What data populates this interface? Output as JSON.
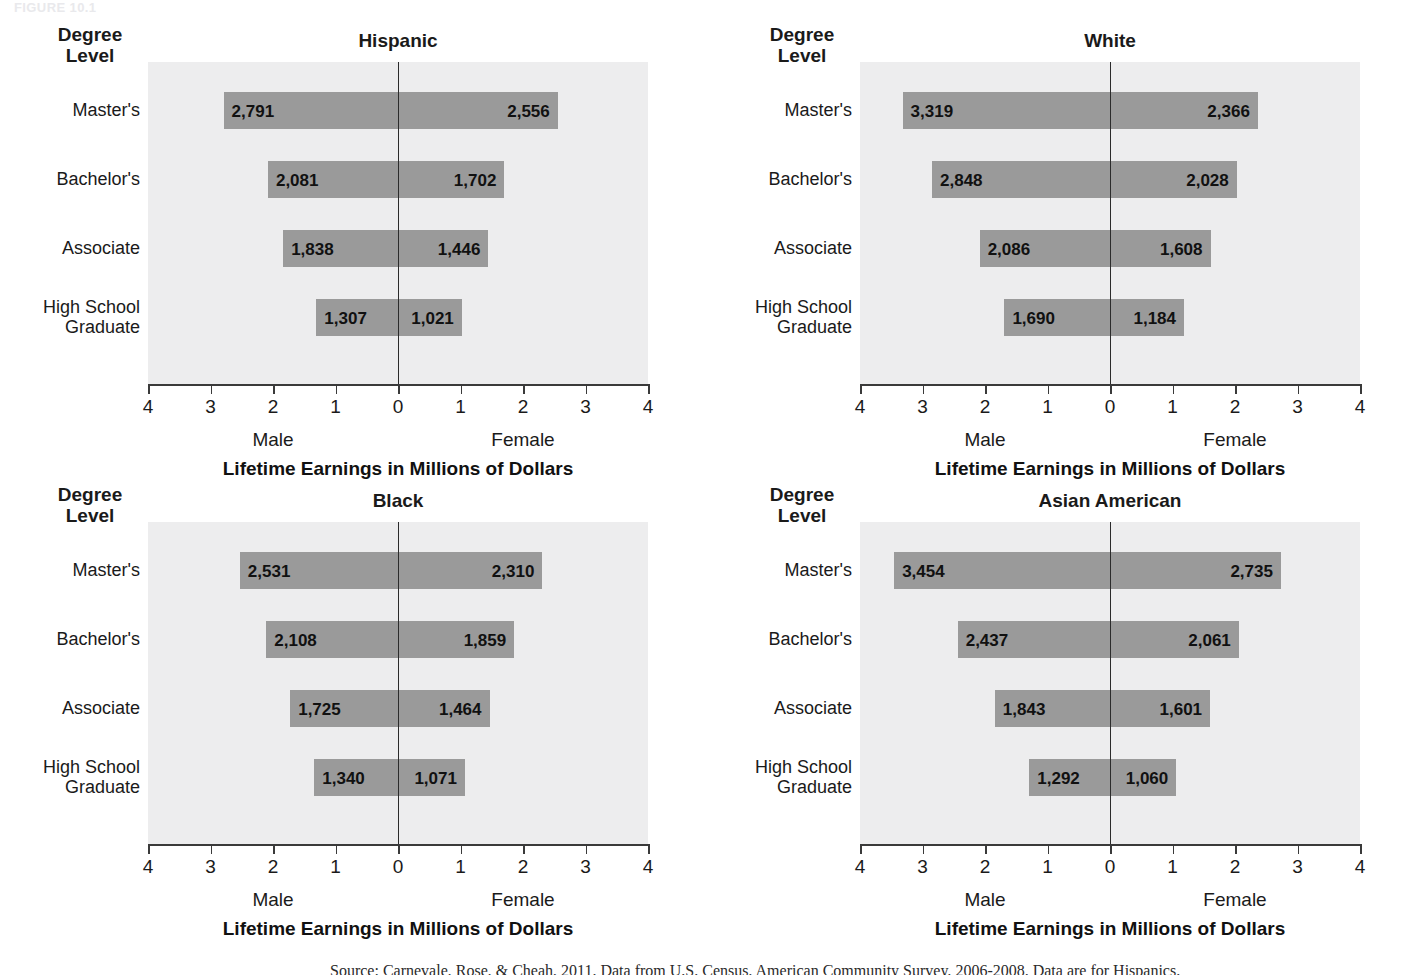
{
  "figure": {
    "tag": "FIGURE 10.1"
  },
  "common": {
    "degree_level_heading": "Degree\nLevel",
    "axis_title": "Lifetime Earnings in Millions of Dollars",
    "male_label": "Male",
    "female_label": "Female",
    "row_labels": [
      "Master's",
      "Bachelor's",
      "Associate",
      "High School\nGraduate"
    ],
    "tick_labels": [
      "4",
      "3",
      "2",
      "1",
      "0",
      "1",
      "2",
      "3",
      "4"
    ],
    "axis_range_millions": [
      -4,
      4
    ],
    "bar_color": "#9a9a9a",
    "plot_background": "#ededee",
    "axis_color": "#3a3a3a"
  },
  "source_note": "Source: Carnevale, Rose, & Cheah, 2011. Data from U.S. Census, American Community Survey, 2006-2008. Data are for Hispanics.",
  "chart_data": [
    {
      "type": "bar",
      "subtype": "diverging-horizontal",
      "title": "Hispanic",
      "xlabel": "Lifetime Earnings in Millions of Dollars",
      "ylabel": "Degree Level",
      "xlim": [
        -4,
        4
      ],
      "grid": false,
      "categories": [
        "Master's",
        "Bachelor's",
        "Associate",
        "High School Graduate"
      ],
      "series": [
        {
          "name": "Male",
          "direction": "left",
          "values": [
            2791,
            2081,
            1838,
            1307
          ],
          "labels": [
            "2,791",
            "2,081",
            "1,838",
            "1,307"
          ]
        },
        {
          "name": "Female",
          "direction": "right",
          "values": [
            2556,
            1702,
            1446,
            1021
          ],
          "labels": [
            "2,556",
            "1,702",
            "1,446",
            "1,021"
          ]
        }
      ]
    },
    {
      "type": "bar",
      "subtype": "diverging-horizontal",
      "title": "White",
      "xlabel": "Lifetime Earnings in Millions of Dollars",
      "ylabel": "Degree Level",
      "xlim": [
        -4,
        4
      ],
      "grid": false,
      "categories": [
        "Master's",
        "Bachelor's",
        "Associate",
        "High School Graduate"
      ],
      "series": [
        {
          "name": "Male",
          "direction": "left",
          "values": [
            3319,
            2848,
            2086,
            1690
          ],
          "labels": [
            "3,319",
            "2,848",
            "2,086",
            "1,690"
          ]
        },
        {
          "name": "Female",
          "direction": "right",
          "values": [
            2366,
            2028,
            1608,
            1184
          ],
          "labels": [
            "2,366",
            "2,028",
            "1,608",
            "1,184"
          ]
        }
      ]
    },
    {
      "type": "bar",
      "subtype": "diverging-horizontal",
      "title": "Black",
      "xlabel": "Lifetime Earnings in Millions of Dollars",
      "ylabel": "Degree Level",
      "xlim": [
        -4,
        4
      ],
      "grid": false,
      "categories": [
        "Master's",
        "Bachelor's",
        "Associate",
        "High School Graduate"
      ],
      "series": [
        {
          "name": "Male",
          "direction": "left",
          "values": [
            2531,
            2108,
            1725,
            1340
          ],
          "labels": [
            "2,531",
            "2,108",
            "1,725",
            "1,340"
          ]
        },
        {
          "name": "Female",
          "direction": "right",
          "values": [
            2310,
            1859,
            1464,
            1071
          ],
          "labels": [
            "2,310",
            "1,859",
            "1,464",
            "1,071"
          ]
        }
      ]
    },
    {
      "type": "bar",
      "subtype": "diverging-horizontal",
      "title": "Asian American",
      "xlabel": "Lifetime Earnings in Millions of Dollars",
      "ylabel": "Degree Level",
      "xlim": [
        -4,
        4
      ],
      "grid": false,
      "categories": [
        "Master's",
        "Bachelor's",
        "Associate",
        "High School Graduate"
      ],
      "series": [
        {
          "name": "Male",
          "direction": "left",
          "values": [
            3454,
            2437,
            1843,
            1292
          ],
          "labels": [
            "3,454",
            "2,437",
            "1,843",
            "1,292"
          ]
        },
        {
          "name": "Female",
          "direction": "right",
          "values": [
            2735,
            2061,
            1601,
            1060
          ],
          "labels": [
            "2,735",
            "2,061",
            "1,601",
            "1,060"
          ]
        }
      ]
    }
  ]
}
